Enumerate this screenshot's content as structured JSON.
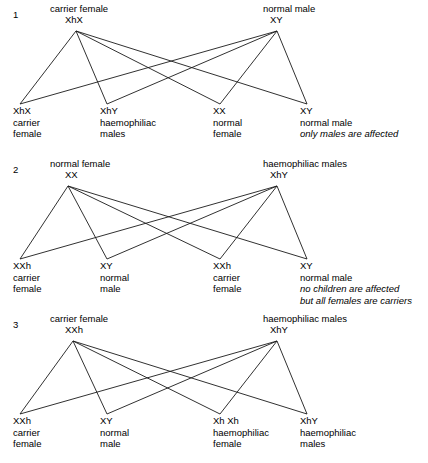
{
  "diagram": {
    "title_semantic": "haemophilia-sex-linked-inheritance-crosses",
    "crosses": [
      {
        "index": "1",
        "parents": {
          "left": {
            "description": "carrier female",
            "genotype": "XhX"
          },
          "right": {
            "description": "normal male",
            "genotype": "XY"
          }
        },
        "offspring": [
          {
            "genotype": "XhX",
            "line1": "carrier",
            "line2": "female",
            "note": ""
          },
          {
            "genotype": "XhY",
            "line1": "haemophiliac",
            "line2": "males",
            "note": ""
          },
          {
            "genotype": "XX",
            "line1": "normal",
            "line2": "female",
            "note": ""
          },
          {
            "genotype": "XY",
            "line1": "normal male",
            "line2": "",
            "note": "only males are affected"
          }
        ]
      },
      {
        "index": "2",
        "parents": {
          "left": {
            "description": "normal female",
            "genotype": "XX"
          },
          "right": {
            "description": "haemophiliac males",
            "genotype": "XhY"
          }
        },
        "offspring": [
          {
            "genotype": "XXh",
            "line1": "carrier",
            "line2": "female",
            "note": ""
          },
          {
            "genotype": "XY",
            "line1": "normal",
            "line2": "male",
            "note": ""
          },
          {
            "genotype": "XXh",
            "line1": "carrier",
            "line2": "female",
            "note": ""
          },
          {
            "genotype": "XY",
            "line1": "normal male",
            "line2": "",
            "note": "no children are affected",
            "note2": "but all females are carriers"
          }
        ]
      },
      {
        "index": "3",
        "parents": {
          "left": {
            "description": "carrier female",
            "genotype": "XXh"
          },
          "right": {
            "description": "haemophiliac males",
            "genotype": "XhY"
          }
        },
        "offspring": [
          {
            "genotype": "XXh",
            "line1": "carrier",
            "line2": "female",
            "note": ""
          },
          {
            "genotype": "XY",
            "line1": "normal",
            "line2": "male",
            "note": ""
          },
          {
            "genotype": "Xh Xh",
            "line1": "haemophiliac",
            "line2": "female",
            "note": ""
          },
          {
            "genotype": "XhY",
            "line1": "haemophiliac",
            "line2": "males",
            "note": ""
          }
        ]
      }
    ],
    "colors": {
      "line": "#1a1a1a",
      "text": "#000000",
      "background": "#ffffff"
    }
  }
}
